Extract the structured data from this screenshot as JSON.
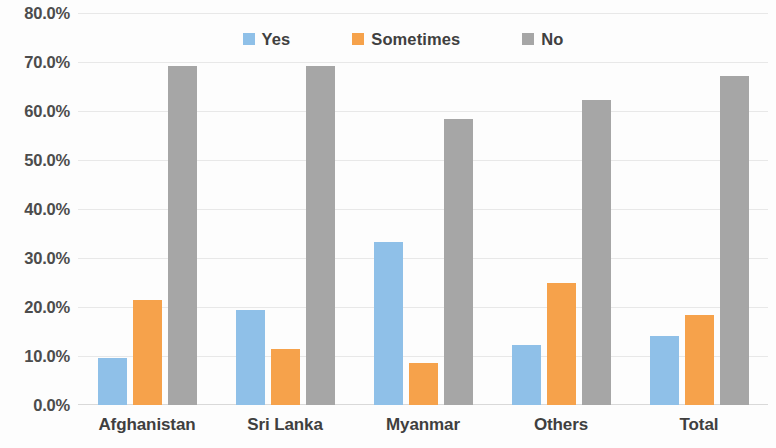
{
  "chart_data": {
    "type": "bar",
    "title": "",
    "subtitle": "",
    "xlabel": "",
    "ylabel": "",
    "categories": [
      "Afghanistan",
      "Sri Lanka",
      "Myanmar",
      "Others",
      "Total"
    ],
    "series": [
      {
        "name": "Yes",
        "color": "#8FC0E8",
        "values": [
          9.5,
          19.3,
          33.3,
          12.2,
          14.0
        ]
      },
      {
        "name": "Sometimes",
        "color": "#F6A24B",
        "values": [
          21.5,
          11.5,
          8.5,
          24.8,
          18.4
        ]
      },
      {
        "name": "No",
        "color": "#A6A6A6",
        "values": [
          69.2,
          69.2,
          58.3,
          62.3,
          67.2
        ]
      }
    ],
    "ylim": [
      0,
      80
    ],
    "ytick_step": 10,
    "ytick_labels": [
      "80.0%",
      "70.0%",
      "60.0%",
      "50.0%",
      "40.0%",
      "30.0%",
      "20.0%",
      "10.0%",
      "0.0%"
    ],
    "ytick_values": [
      80,
      70,
      60,
      50,
      40,
      30,
      20,
      10,
      0
    ],
    "grid": true,
    "grid_axis": "y",
    "legend_position": "top-center",
    "value_unit": "%"
  }
}
